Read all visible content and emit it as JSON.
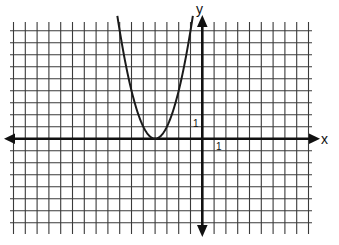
{
  "chart_data": {
    "type": "line",
    "title": "",
    "xlabel": "x",
    "ylabel": "y",
    "x_tick_label": "1",
    "y_tick_label": "1",
    "grid": true,
    "xlim": [
      -16,
      9
    ],
    "ylim": [
      -7,
      9
    ],
    "series": [
      {
        "name": "parabola",
        "equation": "y = (x + 4)^2",
        "vertex": [
          -4,
          0
        ],
        "x": [
          -7.2,
          -7,
          -6,
          -5,
          -4,
          -3,
          -2,
          -1,
          -0.8
        ],
        "y": [
          10.24,
          9,
          4,
          1,
          0,
          1,
          4,
          9,
          10.24
        ]
      }
    ]
  },
  "labels": {
    "x_axis": "x",
    "y_axis": "y",
    "x_unit": "1",
    "y_unit": "1"
  },
  "colors": {
    "grid": "#3a3a3a",
    "axis": "#111111",
    "curve": "#1a1a1a",
    "background": "#ffffff"
  }
}
